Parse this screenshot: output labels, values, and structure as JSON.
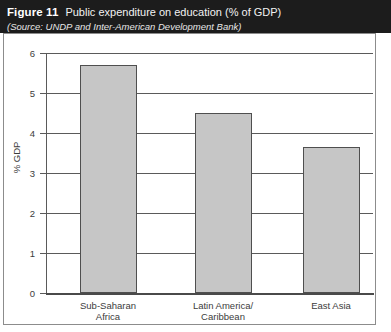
{
  "caption": {
    "figure_number": "Figure 11",
    "title": "Public expenditure on education (% of GDP)",
    "source": "(Source: UNDP and Inter-American Development Bank)"
  },
  "chart_data": {
    "type": "bar",
    "title": "Public expenditure on education (% of GDP)",
    "xlabel": "",
    "ylabel": "% GDP",
    "categories": [
      "Sub-Saharan\nAfrica",
      "Latin America/\nCaribbean",
      "East Asia"
    ],
    "values": [
      5.7,
      4.5,
      3.65
    ],
    "ylim": [
      0,
      6
    ],
    "yticks": [
      0,
      1,
      2,
      3,
      4,
      5,
      6
    ],
    "ytick_labels": [
      "0",
      "1",
      "2",
      "3",
      "4",
      "5",
      "6"
    ],
    "grid": true,
    "legend": "none",
    "bar_color": "#c6c6c6",
    "bar_edge_color": "#4f4f4f",
    "axis_color": "#5a5a5a",
    "band_color": "#1c1c1c"
  }
}
